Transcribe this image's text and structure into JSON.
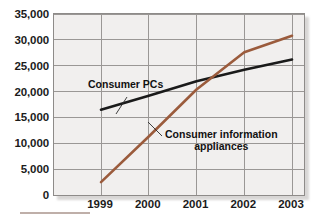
{
  "chart_data": {
    "type": "line",
    "title": "",
    "subtitle": "",
    "xlabel": "",
    "ylabel": "",
    "x": [
      "1999",
      "2000",
      "2001",
      "2002",
      "2003"
    ],
    "categories": [
      "1999",
      "2000",
      "2001",
      "2002",
      "2003"
    ],
    "ylim": [
      0,
      35000
    ],
    "xlim": [
      "1999",
      "2003"
    ],
    "yticks": [
      "0",
      "5,000",
      "10,000",
      "15,000",
      "20,000",
      "25,000",
      "30,000",
      "35,000"
    ],
    "ytick_values": [
      0,
      5000,
      10000,
      15000,
      20000,
      25000,
      30000,
      35000
    ],
    "xticks": [
      "1999",
      "2000",
      "2001",
      "2002",
      "2003"
    ],
    "grid": true,
    "grid_axes": "both",
    "legend": "none",
    "legend_position": "inline-annotations",
    "series": [
      {
        "name": "Consumer PCs",
        "color": "#1a1a1a",
        "values": [
          16500,
          19200,
          22000,
          24200,
          26200
        ]
      },
      {
        "name": "Consumer information appliances",
        "color": "#9b5b3c",
        "values": [
          2500,
          11300,
          20400,
          27600,
          30800
        ]
      }
    ],
    "annotations": [
      {
        "id": "consumer-pcs",
        "text": "Consumer PCs",
        "lines": [
          "Consumer PCs"
        ],
        "target_series": "Consumer PCs"
      },
      {
        "id": "consumer-information-appliances",
        "text": "Consumer information appliances",
        "lines": [
          "Consumer information",
          "appliances"
        ],
        "target_series": "Consumer information appliances"
      }
    ]
  },
  "colors": {
    "series_pcs": "#1a1a1a",
    "series_appliances": "#9b5b3c",
    "plot_background": "#f1efee",
    "grid": "#9a9795",
    "frame": "#8e8b89",
    "page_background": "#ffffff",
    "rule": "#a9948c",
    "text": "#1b1b1b"
  },
  "axes": {
    "y_labels": [
      "35,000",
      "30,000",
      "25,000",
      "20,000",
      "15,000",
      "10,000",
      "5,000",
      "0"
    ],
    "x_labels": [
      "1999",
      "2000",
      "2001",
      "2002",
      "2003"
    ]
  },
  "annotations": {
    "pcs_label": "Consumer PCs",
    "appliances_label_line1": "Consumer information",
    "appliances_label_line2": "appliances"
  }
}
